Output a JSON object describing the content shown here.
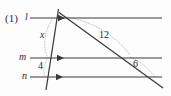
{
  "figure": {
    "problem_number": "(1)",
    "background_color": "#fdfdfd",
    "stroke_color": "#3a3a3a",
    "arc_color": "#b9b9b9",
    "text_color": "#2b2b2b",
    "width": 171,
    "height": 96
  },
  "lines": {
    "parallel": [
      {
        "name": "l",
        "label": "l",
        "y": 18,
        "x_start": 30,
        "x_end": 162,
        "arrow_x": 62
      },
      {
        "name": "m",
        "label": "m",
        "y": 58,
        "x_start": 30,
        "x_end": 162,
        "arrow_x": 62
      },
      {
        "name": "n",
        "label": "n",
        "y": 77,
        "x_start": 30,
        "x_end": 162,
        "arrow_x": 62
      }
    ],
    "transversals": [
      {
        "name": "steep-transversal",
        "x1": 58,
        "y1": 9,
        "x2": 46,
        "y2": 90
      },
      {
        "name": "diagonal-transversal",
        "x1": 60,
        "y1": 13,
        "x2": 163,
        "y2": 88
      }
    ]
  },
  "labels": {
    "problem_number": "(1)",
    "line_l": "l",
    "line_m": "m",
    "line_n": "n",
    "segment_x": "x",
    "segment_4": "4",
    "segment_12": "12",
    "segment_6": "6"
  },
  "arcs": [
    {
      "name": "arc-x",
      "description": "dotted arc spanning segment x between lines l and m on steep transversal"
    },
    {
      "name": "arc-12",
      "description": "dotted arc spanning segment 12 along diagonal transversal between lines l and m"
    },
    {
      "name": "arc-6",
      "description": "dotted arc spanning segment 6 along diagonal transversal between lines m and n"
    },
    {
      "name": "arc-4",
      "description": "dotted arc spanning segment 4 along steep transversal between lines m and n"
    }
  ]
}
